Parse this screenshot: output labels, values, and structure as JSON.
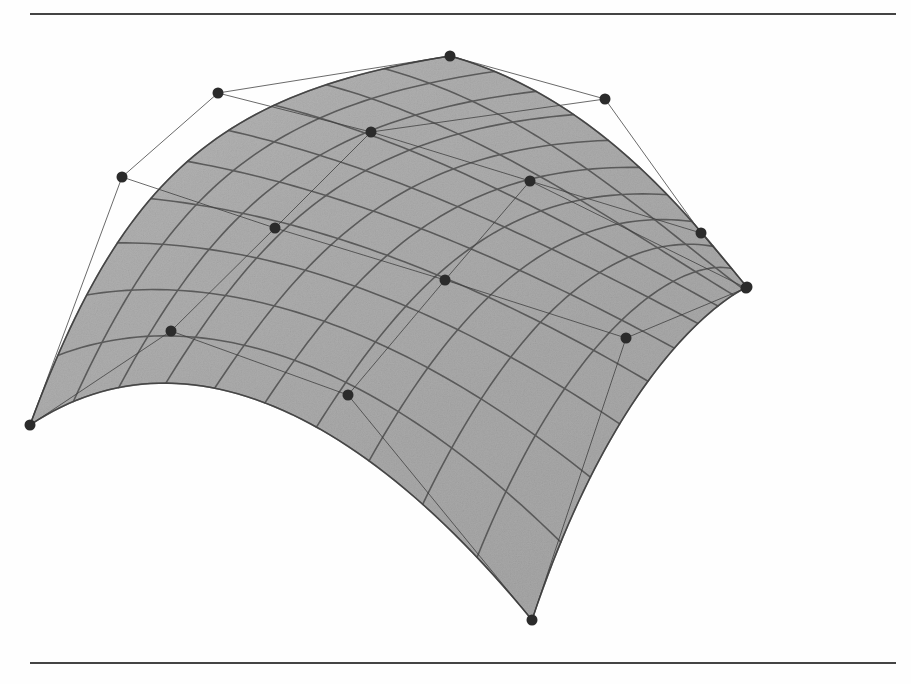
{
  "figure": {
    "kind": "bicubic-bezier-surface-patch",
    "caption": "",
    "background_color": "#fefefe",
    "rules": {
      "top": {
        "x": 30,
        "y": 13,
        "width": 866,
        "color": "#2a2a2a"
      },
      "bottom": {
        "x": 30,
        "y": 662,
        "width": 866,
        "color": "#2a2a2a"
      }
    },
    "surface": {
      "fill_color": "#a9a9a9",
      "fill_color_dark": "#8c8c8c",
      "fill_color_light": "#c2c2c2",
      "isoline_color": "#4a4a4a",
      "isoline_width": 1.6,
      "u_divisions": 10,
      "v_divisions": 10,
      "shading": "grainy-halftone-gray"
    },
    "control_net": {
      "rows": 4,
      "cols": 4,
      "line_color": "#3c3c3c",
      "line_width": 0.9,
      "point_color": "#2b2b2b",
      "point_radius": 5.5,
      "points": [
        [
          [
            30,
            425
          ],
          [
            122,
            177
          ],
          [
            218,
            93
          ],
          [
            450,
            56
          ]
        ],
        [
          [
            171,
            331
          ],
          [
            275,
            228
          ],
          [
            371,
            132
          ],
          [
            605,
            99
          ]
        ],
        [
          [
            348,
            395
          ],
          [
            445,
            280
          ],
          [
            530,
            181
          ],
          [
            701,
            233
          ]
        ],
        [
          [
            532,
            620
          ],
          [
            626,
            338
          ],
          [
            746,
            288
          ],
          [
            747,
            287
          ]
        ]
      ],
      "visible_point_count": 16
    },
    "chart_data": {
      "type": "scatter",
      "title": "Bicubic Bezier surface patch with control net",
      "xlabel": "",
      "ylabel": "",
      "xlim": [
        0,
        911
      ],
      "ylim": [
        0,
        684
      ],
      "grid": false,
      "legend": null,
      "series": [
        {
          "name": "control points",
          "x": [
            30,
            122,
            218,
            450,
            171,
            275,
            371,
            605,
            348,
            445,
            530,
            701,
            532,
            626,
            746,
            747
          ],
          "y": [
            425,
            177,
            93,
            56,
            331,
            228,
            132,
            99,
            395,
            280,
            181,
            233,
            620,
            338,
            288,
            287
          ]
        }
      ],
      "annotations": [
        {
          "label": "surface corner (left)",
          "x": 30,
          "y": 425
        },
        {
          "label": "surface corner (top)",
          "x": 450,
          "y": 56
        },
        {
          "label": "surface corner (right)",
          "x": 747,
          "y": 287
        },
        {
          "label": "surface corner (bottom)",
          "x": 532,
          "y": 620
        }
      ]
    }
  }
}
